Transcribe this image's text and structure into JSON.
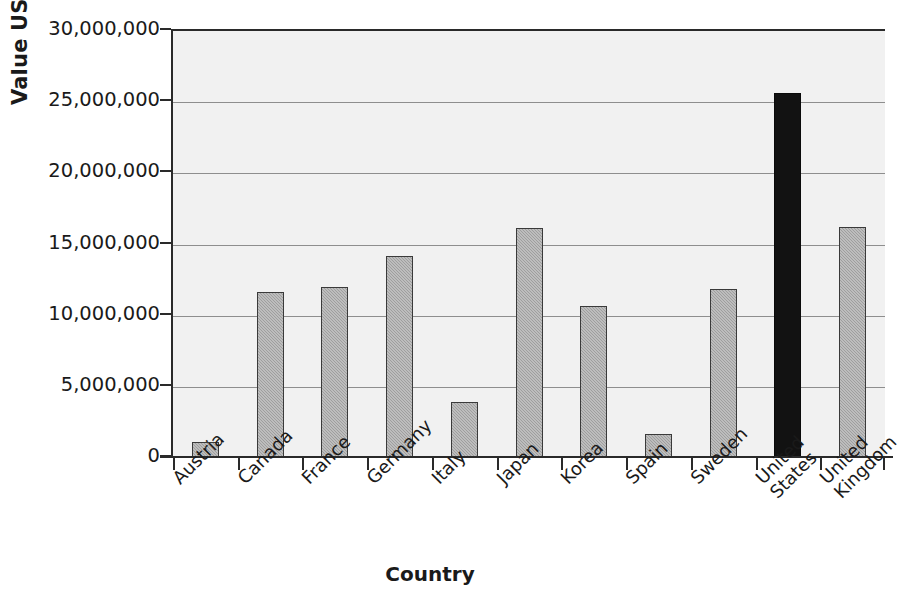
{
  "chart_data": {
    "type": "bar",
    "title": "",
    "xlabel": "Country",
    "ylabel": "Value US$ '000",
    "ylim": [
      0,
      30000000
    ],
    "ytick_step": 5000000,
    "ytick_labels": [
      "30,000,000",
      "25,000,000",
      "20,000,000",
      "15,000,000",
      "10,000,000",
      "5,000,000",
      "0"
    ],
    "ytick_values": [
      30000000,
      25000000,
      20000000,
      15000000,
      10000000,
      5000000,
      0
    ],
    "grid": true,
    "legend": "none",
    "categories": [
      "Austria",
      "Canada",
      "France",
      "Germany",
      "Italy",
      "Japan",
      "Korea",
      "Spain",
      "Sweden",
      "United States",
      "United Kingdom"
    ],
    "category_lines": [
      [
        "Austria"
      ],
      [
        "Canada"
      ],
      [
        "France"
      ],
      [
        "Germany"
      ],
      [
        "Italy"
      ],
      [
        "Japan"
      ],
      [
        "Korea"
      ],
      [
        "Spain"
      ],
      [
        "Sweden"
      ],
      [
        "United",
        "States"
      ],
      [
        "United",
        "Kingdom"
      ]
    ],
    "values": [
      1150000,
      11650000,
      12050000,
      14200000,
      3950000,
      16150000,
      10650000,
      1700000,
      11850000,
      25650000,
      16200000
    ],
    "highlight_category": "United States",
    "colors": {
      "bar_fill": "#9e9e9e",
      "bar_border": "#3a3a3a",
      "highlight_fill": "#121212",
      "plot_background": "#f1f1f1",
      "gridline": "#8e8e8e",
      "axis": "#2a2a2a",
      "text": "#1a1a1a"
    }
  }
}
